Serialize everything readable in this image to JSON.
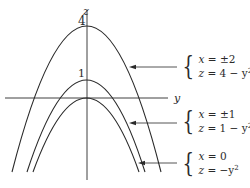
{
  "axes": {
    "vertical_label": "z",
    "horizontal_label": "y"
  },
  "ticks": {
    "four": "4",
    "one": "1"
  },
  "annotations": [
    {
      "line1_var": "x",
      "line1_rhs": "= ±2",
      "line2_var": "z",
      "line2_rhs": "= 4 − y",
      "line2_exp": "2"
    },
    {
      "line1_var": "x",
      "line1_rhs": "= ±1",
      "line2_var": "z",
      "line2_rhs": "= 1 − y",
      "line2_exp": "2"
    },
    {
      "line1_var": "x",
      "line1_rhs": "= 0",
      "line2_var": "z",
      "line2_rhs": "= −y",
      "line2_exp": "2"
    }
  ],
  "curves": [
    {
      "name": "z = 4 - y^2",
      "apex_z": 4
    },
    {
      "name": "z = 1 - y^2",
      "apex_z": 1
    },
    {
      "name": "z = -y^2",
      "apex_z": 0
    }
  ],
  "colors": {
    "stroke": "#2a2a2a",
    "background": "#ffffff"
  }
}
